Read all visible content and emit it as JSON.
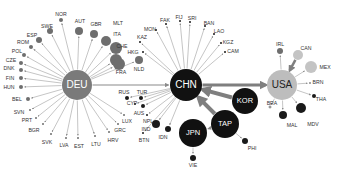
{
  "diagram": {
    "type": "network",
    "colors": {
      "hub_deu": "#7a7a7a",
      "hub_chn": "#111111",
      "hub_usa": "#bdbdbd",
      "node_dark": "#1a1a1a",
      "node_gray": "#6e6e6e",
      "node_light": "#c4c4c4",
      "edge": "#8a8a8a",
      "edge_thick": "#7f7f7f",
      "label": "#333333"
    },
    "hubs": [
      {
        "id": "DEU",
        "label": "DEU",
        "x": 77,
        "y": 85,
        "r": 15,
        "color": "#7a7a7a",
        "text_color": "#ffffff"
      },
      {
        "id": "CHN",
        "label": "CHN",
        "x": 186,
        "y": 85,
        "r": 16,
        "color": "#111111",
        "text_color": "#ffffff"
      },
      {
        "id": "USA",
        "label": "USA",
        "x": 282,
        "y": 85,
        "r": 15,
        "color": "#bdbdbd",
        "text_color": "#222222"
      },
      {
        "id": "KOR",
        "label": "KOR",
        "x": 245,
        "y": 101,
        "r": 13,
        "color": "#111111",
        "text_color": "#ffffff"
      },
      {
        "id": "TAP",
        "label": "TAP",
        "x": 225,
        "y": 124,
        "r": 14,
        "color": "#111111",
        "text_color": "#ffffff"
      },
      {
        "id": "JPN",
        "label": "JPN",
        "x": 193,
        "y": 133,
        "r": 14,
        "color": "#111111",
        "text_color": "#ffffff"
      }
    ],
    "deu_nodes": [
      {
        "label": "NOR",
        "x": 61,
        "y": 20,
        "r": 2,
        "lx": 61,
        "ly": 15
      },
      {
        "label": "SWE",
        "x": 50,
        "y": 31,
        "r": 3,
        "lx": 47,
        "ly": 27
      },
      {
        "label": "AUT",
        "x": 79,
        "y": 31,
        "r": 4,
        "lx": 80,
        "ly": 22
      },
      {
        "label": "GBR",
        "x": 94,
        "y": 34,
        "r": 4,
        "lx": 96,
        "ly": 25
      },
      {
        "label": "ESP",
        "x": 39,
        "y": 40,
        "r": 3,
        "lx": 32,
        "ly": 36
      },
      {
        "label": "MLT",
        "x": 106,
        "y": 41,
        "r": 5,
        "lx": 118,
        "ly": 24
      },
      {
        "label": "ITA",
        "x": 116,
        "y": 48,
        "r": 6,
        "lx": 117,
        "ly": 35
      },
      {
        "label": "ROM",
        "x": 31,
        "y": 47,
        "r": 2,
        "lx": 23,
        "ly": 43
      },
      {
        "label": "POL",
        "x": 24,
        "y": 55,
        "r": 2,
        "lx": 17,
        "ly": 52
      },
      {
        "label": "CHE",
        "x": 116,
        "y": 60,
        "r": 6,
        "lx": 122,
        "ly": 47
      },
      {
        "label": "CZE",
        "x": 21,
        "y": 63,
        "r": 2,
        "lx": 11,
        "ly": 61
      },
      {
        "label": "DNK",
        "x": 21,
        "y": 70,
        "r": 2,
        "lx": 9,
        "ly": 69
      },
      {
        "label": "FRA",
        "x": 119,
        "y": 64,
        "r": 6,
        "lx": 121,
        "ly": 73
      },
      {
        "label": "NLD",
        "x": 139,
        "y": 60,
        "r": 4,
        "lx": 139,
        "ly": 70
      },
      {
        "label": "FIN",
        "x": 21,
        "y": 78,
        "r": 2,
        "lx": 10,
        "ly": 79
      },
      {
        "label": "HUN",
        "x": 21,
        "y": 87,
        "r": 2,
        "lx": 9,
        "ly": 88
      },
      {
        "label": "BEL",
        "x": 28,
        "y": 99,
        "r": 2,
        "lx": 17,
        "ly": 100
      },
      {
        "label": "SVN",
        "x": 30,
        "y": 110,
        "r": 1,
        "lx": 19,
        "ly": 113
      },
      {
        "label": "PRT",
        "x": 36,
        "y": 118,
        "r": 1,
        "lx": 27,
        "ly": 121
      },
      {
        "label": "BGR",
        "x": 43,
        "y": 124,
        "r": 1,
        "lx": 34,
        "ly": 131
      },
      {
        "label": "SVK",
        "x": 51,
        "y": 134,
        "r": 1,
        "lx": 47,
        "ly": 143
      },
      {
        "label": "LVA",
        "x": 66,
        "y": 138,
        "r": 1,
        "lx": 64,
        "ly": 146
      },
      {
        "label": "EST",
        "x": 78,
        "y": 138,
        "r": 1,
        "lx": 79,
        "ly": 147
      },
      {
        "label": "LTU",
        "x": 95,
        "y": 136,
        "r": 1,
        "lx": 96,
        "ly": 145
      },
      {
        "label": "HRV",
        "x": 109,
        "y": 132,
        "r": 1,
        "lx": 113,
        "ly": 141
      },
      {
        "label": "GRC",
        "x": 118,
        "y": 124,
        "r": 1,
        "lx": 120,
        "ly": 131
      },
      {
        "label": "LUX",
        "x": 124,
        "y": 115,
        "r": 1,
        "lx": 127,
        "ly": 122
      }
    ],
    "chn_nodes": [
      {
        "label": "HKG",
        "x": 143,
        "y": 52,
        "r": 1,
        "lx": 133,
        "ly": 53
      },
      {
        "label": "KAZ",
        "x": 140,
        "y": 42,
        "r": 1,
        "lx": 142,
        "ly": 38
      },
      {
        "label": "MON",
        "x": 156,
        "y": 30,
        "r": 1,
        "lx": 150,
        "ly": 30
      },
      {
        "label": "FAK",
        "x": 166,
        "y": 24,
        "r": 1,
        "lx": 165,
        "ly": 21
      },
      {
        "label": "FIJ",
        "x": 180,
        "y": 21,
        "r": 1,
        "lx": 179,
        "ly": 18
      },
      {
        "label": "SRI",
        "x": 190,
        "y": 22,
        "r": 1,
        "lx": 192,
        "ly": 19
      },
      {
        "label": "BAN",
        "x": 205,
        "y": 26,
        "r": 1,
        "lx": 209,
        "ly": 24
      },
      {
        "label": "LAO",
        "x": 214,
        "y": 34,
        "r": 1,
        "lx": 219,
        "ly": 32
      },
      {
        "label": "KGZ",
        "x": 221,
        "y": 43,
        "r": 1,
        "lx": 228,
        "ly": 43
      },
      {
        "label": "CAM",
        "x": 225,
        "y": 52,
        "r": 1,
        "lx": 233,
        "ly": 52
      },
      {
        "label": "RUS",
        "x": 127,
        "y": 98,
        "r": 2,
        "lx": 124,
        "ly": 93
      },
      {
        "label": "TUR",
        "x": 141,
        "y": 98,
        "r": 2,
        "lx": 142,
        "ly": 93
      },
      {
        "label": "CYP",
        "x": 135,
        "y": 104,
        "r": 1,
        "lx": 132,
        "ly": 104
      },
      {
        "label": "AUS",
        "x": 143,
        "y": 106,
        "r": 2,
        "lx": 139,
        "ly": 114
      },
      {
        "label": "NPL",
        "x": 147,
        "y": 115,
        "r": 1,
        "lx": 148,
        "ly": 122
      },
      {
        "label": "IND",
        "x": 156,
        "y": 124,
        "r": 4,
        "lx": 146,
        "ly": 130
      },
      {
        "label": "BTN",
        "x": 143,
        "y": 133,
        "r": 1,
        "lx": 144,
        "ly": 141
      },
      {
        "label": "IDN",
        "x": 168,
        "y": 129,
        "r": 3,
        "lx": 163,
        "ly": 138
      }
    ],
    "usa_nodes": [
      {
        "label": "IRL",
        "x": 280,
        "y": 51,
        "r": 3,
        "lx": 280,
        "ly": 45,
        "color": "#6e6e6e"
      },
      {
        "label": "CAN",
        "x": 298,
        "y": 55,
        "r": 5,
        "lx": 306,
        "ly": 49,
        "color": "#c4c4c4"
      },
      {
        "label": "MEX",
        "x": 311,
        "y": 67,
        "r": 6,
        "lx": 325,
        "ly": 68,
        "color": "#c4c4c4"
      },
      {
        "label": "BRN",
        "x": 310,
        "y": 83,
        "r": 1,
        "lx": 318,
        "ly": 83,
        "color": "#8a8a8a"
      },
      {
        "label": "THA",
        "x": 314,
        "y": 96,
        "r": 2,
        "lx": 321,
        "ly": 100,
        "color": "#1a1a1a"
      },
      {
        "label": "BRA",
        "x": 270,
        "y": 107,
        "r": 1,
        "lx": 272,
        "ly": 104,
        "color": "#ffffff"
      },
      {
        "label": "MAL",
        "x": 283,
        "y": 115,
        "r": 4,
        "lx": 292,
        "ly": 126,
        "color": "#1a1a1a"
      },
      {
        "label": "MDV",
        "x": 301,
        "y": 108,
        "r": 5,
        "lx": 313,
        "ly": 125,
        "color": "#1a1a1a"
      }
    ],
    "asia_nodes": [
      {
        "label": "PHI",
        "x": 245,
        "y": 141,
        "r": 3,
        "lx": 252,
        "ly": 149,
        "parent": "TAP"
      },
      {
        "label": "VIE",
        "x": 193,
        "y": 158,
        "r": 3,
        "lx": 193,
        "ly": 166,
        "parent": "JPN"
      }
    ],
    "thick_edges": [
      {
        "from": "DEU",
        "to": "CHN",
        "width": 1.2
      },
      {
        "from": "CHN",
        "to": "USA",
        "width": 3
      },
      {
        "from": "KOR",
        "to": "CHN",
        "width": 4
      },
      {
        "from": "TAP",
        "to": "CHN",
        "width": 4
      },
      {
        "from": "TAP",
        "to": "JPN",
        "width": 1
      },
      {
        "from": "CAN",
        "to": "USA",
        "width": 2.5
      }
    ]
  }
}
